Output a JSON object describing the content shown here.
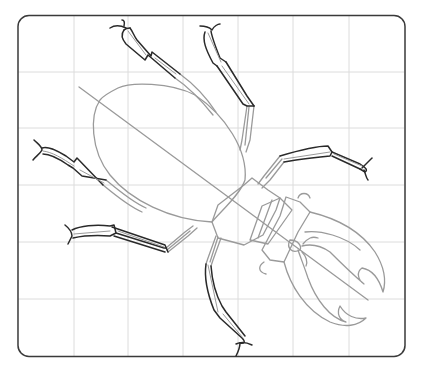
{
  "illustration": {
    "subject": "stag beetle drawing step",
    "frame": {
      "x": 17,
      "y": 15,
      "width": 388,
      "height": 342,
      "radius": 12,
      "stroke": "#3a3a3a"
    },
    "grid": {
      "color": "#dcdcdc",
      "vertical_lines_x": [
        74,
        128,
        183,
        238,
        293,
        349
      ],
      "horizontal_lines_y": [
        72,
        128,
        185,
        242,
        299
      ]
    },
    "colors": {
      "guide_stroke": "#9a9a9a",
      "ink_stroke": "#2a2a2a",
      "background": "#ffffff"
    }
  }
}
